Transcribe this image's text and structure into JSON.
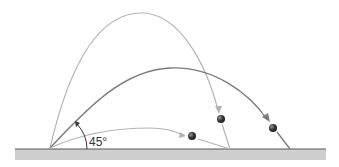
{
  "diagram": {
    "angle_label": "45°",
    "trajectories": [
      {
        "name": "high-angle",
        "color": "#b0b0b0"
      },
      {
        "name": "45-degree",
        "color": "#7a7a7a"
      },
      {
        "name": "low-angle",
        "color": "#b0b0b0"
      }
    ],
    "colors": {
      "ground": "#cfcfcf",
      "ground_line": "#555555",
      "ball": "#333333"
    }
  }
}
